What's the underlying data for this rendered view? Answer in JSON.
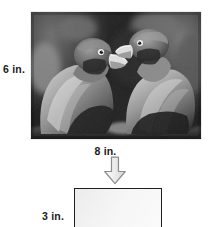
{
  "diagram": {
    "original": {
      "height_label": "6 in.",
      "width_label": "8 in.",
      "subject": "two-parrots-photo",
      "style": "grayscale photograph"
    },
    "arrow": {
      "icon": "arrow-down-icon",
      "direction": "down",
      "fill_color": "#e6e6e6",
      "stroke_color": "#8c8c8c"
    },
    "resized": {
      "height_label": "3 in.",
      "width_label": "",
      "fill_color": "#f4f4f4",
      "border_color": "#1f1f1f"
    }
  }
}
